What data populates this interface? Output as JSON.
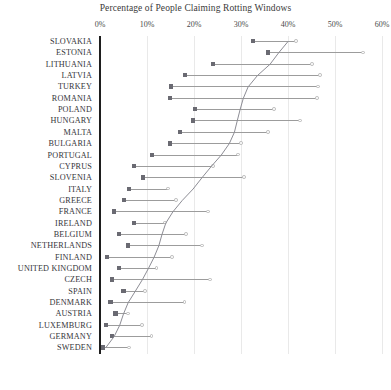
{
  "chart_data": {
    "type": "bar",
    "title": "Percentage of People Claiming Rotting Windows",
    "xlabel": "",
    "ylabel": "",
    "xlim": [
      0,
      60
    ],
    "xunit": "%",
    "grid": true,
    "legend": "none",
    "orientation": "horizontal",
    "tick_labels": [
      "0%",
      "10%",
      "20%",
      "30%",
      "40%",
      "50%",
      "60%"
    ],
    "ticks": [
      0,
      10,
      20,
      30,
      40,
      50,
      60
    ],
    "categories": [
      "SLOVAKIA",
      "ESTONIA",
      "LITHUANIA",
      "LATVIA",
      "TURKEY",
      "ROMANIA",
      "POLAND",
      "HUNGARY",
      "MALTA",
      "BULGARIA",
      "PORTUGAL",
      "CYPRUS",
      "SLOVENIA",
      "ITALY",
      "GREECE",
      "FRANCE",
      "IRELAND",
      "BELGIUM",
      "NETHERLANDS",
      "FINLAND",
      "UNITED KINGDOM",
      "CZECH",
      "SPAIN",
      "DENMARK",
      "AUSTRIA",
      "LUXEMBURG",
      "GERMANY",
      "SWEDEN"
    ],
    "series": [
      {
        "name": "low",
        "marker": "filled-square",
        "values": [
          32.5,
          35.7,
          24.0,
          18.1,
          15.1,
          14.9,
          20.2,
          19.8,
          17.0,
          14.9,
          11.1,
          7.2,
          9.1,
          6.2,
          5.1,
          3.0,
          7.2,
          4.0,
          5.9,
          1.5,
          4.0,
          2.6,
          5.0,
          2.2,
          3.3,
          1.3,
          2.6,
          0.6
        ]
      },
      {
        "name": "high",
        "marker": "hollow-circle",
        "values": [
          41.7,
          56.0,
          45.1,
          46.8,
          46.4,
          46.2,
          37.0,
          42.5,
          35.7,
          30.0,
          29.4,
          24.0,
          30.6,
          14.5,
          16.2,
          23.0,
          13.8,
          18.3,
          21.7,
          15.3,
          12.0,
          23.4,
          9.6,
          18.0,
          6.0,
          8.9,
          11.0,
          6.2
        ]
      }
    ],
    "trend_curve": [
      40.0,
      38.0,
      36.2,
      33.5,
      31.5,
      30.5,
      29.8,
      29.2,
      28.6,
      27.5,
      25.8,
      23.7,
      21.7,
      19.8,
      17.5,
      15.5,
      14.0,
      13.2,
      12.5,
      11.5,
      10.3,
      9.0,
      7.5,
      6.0,
      5.0,
      4.2,
      3.0,
      1.2
    ]
  },
  "colors": {
    "axis": "#1e1e1e",
    "gridline": "#e9e9e9",
    "range_line": "#9c9c9c",
    "marker_low": "#6a6a72",
    "marker_high_stroke": "#b9b9b9",
    "trend": "#8d8d95",
    "text": "#35353a"
  }
}
